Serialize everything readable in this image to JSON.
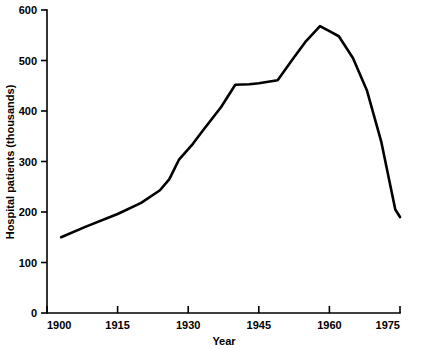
{
  "chart_data": {
    "type": "line",
    "title": "",
    "xlabel": "Year",
    "ylabel": "Hospital patients (thousands)",
    "xlim": [
      1900,
      1975
    ],
    "ylim": [
      0,
      600
    ],
    "xticks": [
      1900,
      1915,
      1930,
      1945,
      1960,
      1975
    ],
    "xtick_labels": [
      "1900",
      "1915",
      "1930",
      "1945",
      "1960",
      "1975"
    ],
    "yticks": [
      0,
      100,
      200,
      300,
      400,
      500,
      600
    ],
    "ytick_labels": [
      "0",
      "100",
      "200",
      "300",
      "400",
      "500",
      "600"
    ],
    "grid": false,
    "legend": null,
    "line_color": "#000000",
    "x": [
      1903,
      1908,
      1915,
      1920,
      1924,
      1926,
      1928,
      1931,
      1933,
      1937,
      1940,
      1943,
      1945,
      1947,
      1949,
      1952,
      1955,
      1958,
      1960,
      1962,
      1965,
      1968,
      1971,
      1974,
      1975
    ],
    "values": [
      150,
      170,
      196,
      218,
      243,
      265,
      303,
      335,
      360,
      408,
      452,
      453,
      455,
      458,
      461,
      500,
      538,
      568,
      558,
      548,
      505,
      440,
      340,
      205,
      190
    ],
    "annotations": []
  },
  "axis": {
    "y_title": "Hospital patients (thousands)",
    "x_title": "Year"
  }
}
